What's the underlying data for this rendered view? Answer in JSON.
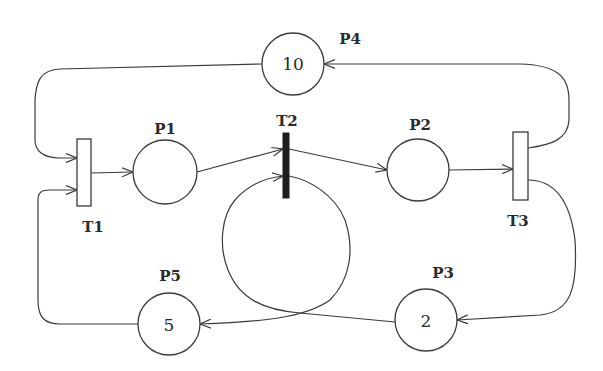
{
  "diagram": {
    "type": "petri-net",
    "places": [
      {
        "id": "P1",
        "label": "P1",
        "tokens": ""
      },
      {
        "id": "P2",
        "label": "P2",
        "tokens": ""
      },
      {
        "id": "P3",
        "label": "P3",
        "tokens": "2"
      },
      {
        "id": "P4",
        "label": "P4",
        "tokens": "10"
      },
      {
        "id": "P5",
        "label": "P5",
        "tokens": "5"
      }
    ],
    "transitions": [
      {
        "id": "T1",
        "label": "T1",
        "style": "hollow"
      },
      {
        "id": "T2",
        "label": "T2",
        "style": "filled"
      },
      {
        "id": "T3",
        "label": "T3",
        "style": "hollow"
      }
    ],
    "arcs": [
      {
        "from": "P4",
        "to": "T1"
      },
      {
        "from": "P5",
        "to": "T1"
      },
      {
        "from": "T1",
        "to": "P1"
      },
      {
        "from": "P1",
        "to": "T2"
      },
      {
        "from": "P3",
        "to": "T2"
      },
      {
        "from": "T2",
        "to": "P2"
      },
      {
        "from": "T2",
        "to": "P5"
      },
      {
        "from": "P2",
        "to": "T3"
      },
      {
        "from": "T3",
        "to": "P4"
      },
      {
        "from": "T3",
        "to": "P3"
      }
    ],
    "colors": {
      "line": "#3a3a3a",
      "fired_transition": "#1e1e1e",
      "background": "#ffffff"
    }
  }
}
